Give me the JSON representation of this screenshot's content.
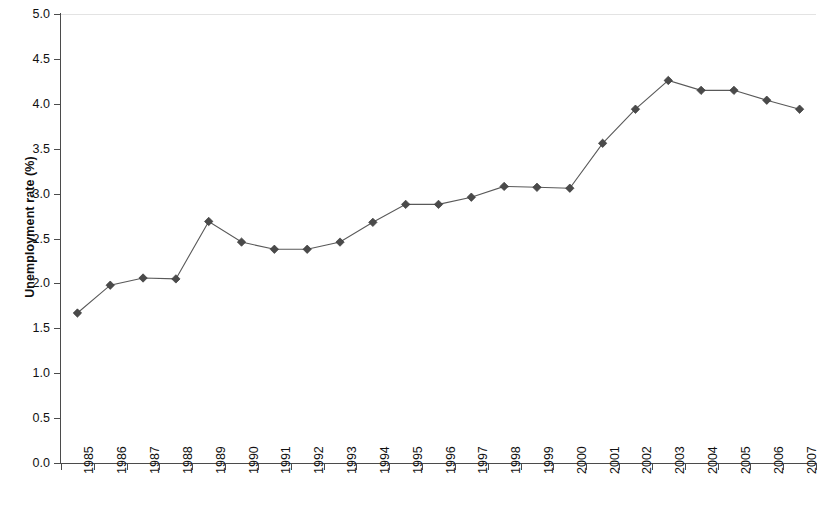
{
  "chart_data": {
    "type": "line",
    "title": "",
    "xlabel": "",
    "ylabel": "Unemployment rate (%)",
    "ylim": [
      0.0,
      5.0
    ],
    "ytick_labels": [
      "5.0",
      "4.5",
      "4.0",
      "3.5",
      "3.0",
      "2.5",
      "2.0",
      "1.5",
      "1.0",
      "0.5",
      "0.0"
    ],
    "ytick_values": [
      5.0,
      4.5,
      4.0,
      3.5,
      3.0,
      2.5,
      2.0,
      1.5,
      1.0,
      0.5,
      0.0
    ],
    "grid": "top-gridline-only",
    "legend": "none",
    "marker": "diamond",
    "line_color": "#595959",
    "marker_color": "#4a4a4a",
    "categories": [
      "1985",
      "1986",
      "1987",
      "1988",
      "1989",
      "1990",
      "1991",
      "1992",
      "1993",
      "1994",
      "1995",
      "1996",
      "1997",
      "1998",
      "1999",
      "2000",
      "2001",
      "2002",
      "2003",
      "2004",
      "2005",
      "2006",
      "2007"
    ],
    "values": [
      1.67,
      1.98,
      2.06,
      2.05,
      2.69,
      2.46,
      2.38,
      2.38,
      2.46,
      2.68,
      2.88,
      2.88,
      2.96,
      3.08,
      3.07,
      3.06,
      3.56,
      3.94,
      4.26,
      4.15,
      4.15,
      4.04,
      3.94
    ],
    "series": [
      {
        "name": "Unemployment rate",
        "values": [
          1.67,
          1.98,
          2.06,
          2.05,
          2.69,
          2.46,
          2.38,
          2.38,
          2.46,
          2.68,
          2.88,
          2.88,
          2.96,
          3.08,
          3.07,
          3.06,
          3.56,
          3.94,
          4.26,
          4.15,
          4.15,
          4.04,
          3.94
        ]
      }
    ]
  }
}
